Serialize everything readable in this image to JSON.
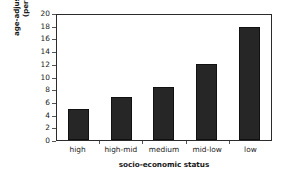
{
  "chart_data": {
    "type": "bar",
    "title": "",
    "subtitle": "",
    "categories": [
      "high",
      "high-mid",
      "medium",
      "mid-low",
      "low"
    ],
    "values": [
      4.9,
      6.7,
      8.4,
      11.9,
      17.8
    ],
    "xlabel": "socio-economic status",
    "ylabel_line1": "age-adjusted incidence",
    "ylabel_line2": "(per 100,000)",
    "ylabel": "age-adjusted incidence (per 100,000)",
    "ylim": [
      0,
      20
    ],
    "ytick_step": 2,
    "yticks": [
      "20",
      "18",
      "16",
      "14",
      "12",
      "10",
      "8",
      "6",
      "4",
      "2",
      "0"
    ],
    "ytick_values": [
      20,
      18,
      16,
      14,
      12,
      10,
      8,
      6,
      4,
      2,
      0
    ],
    "grid": false,
    "legend": false,
    "legend_position": "none",
    "bar_color": "#262626",
    "bar_edge_color": "#111111",
    "frame_color": "#2b2b2b",
    "background_color": "#ffffff",
    "text_color": "#1a1a1a"
  }
}
